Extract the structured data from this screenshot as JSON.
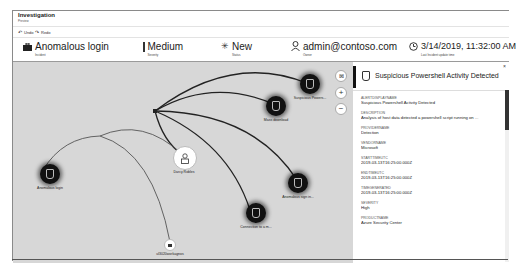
{
  "window": {
    "title": "Investigation",
    "subtitle": "Preview"
  },
  "commands": {
    "undo": "Undo",
    "redo": "Redo"
  },
  "header": {
    "incident": {
      "value": "Anomalous login",
      "label": "Incident",
      "icon": "briefcase-icon"
    },
    "severity": {
      "value": "Medium",
      "label": "Severity",
      "color": "#333333"
    },
    "status": {
      "value": "New",
      "label": "Status",
      "icon": "sparkle-icon"
    },
    "owner": {
      "value": "admin@contoso.com",
      "label": "Owner",
      "icon": "person-icon"
    },
    "updated": {
      "value": "3/14/2019, 11:32:00 AM",
      "label": "Last Incident update time",
      "icon": "clock-icon"
    }
  },
  "graph": {
    "nodes": [
      {
        "id": "suspicious-powershell",
        "label": "Suspicious Powers...",
        "type": "alert"
      },
      {
        "id": "mass-download",
        "label": "Mass download",
        "type": "alert"
      },
      {
        "id": "darcy-robles",
        "label": "Darcy Robles",
        "type": "account"
      },
      {
        "id": "anomalous-login",
        "label": "Anomalous login",
        "type": "alert"
      },
      {
        "id": "anomalous-sign-in",
        "label": "Anomalous sign in...",
        "type": "alert"
      },
      {
        "id": "connection-to",
        "label": "Connection to a m...",
        "type": "alert"
      },
      {
        "id": "host",
        "label": "ul3020workagnos",
        "type": "host"
      }
    ],
    "zoom_controls": {
      "fit": "fit-icon",
      "zoom_in": "+",
      "zoom_out": "−"
    }
  },
  "panel": {
    "title": "Suspicious Powershell Activity Detected",
    "close": "×",
    "fields": [
      {
        "key": "ALERTDISPLAYNAME",
        "value": "Suspicious Powershell Activity Detected"
      },
      {
        "key": "DESCRIPTION",
        "value": "Analysis of host data detected a powershell script running on ..."
      },
      {
        "key": "PROVIDERNAME",
        "value": "Detection"
      },
      {
        "key": "VENDORNAME",
        "value": "Microsoft"
      },
      {
        "key": "STARTTIMEUTC",
        "value": "2019-03-13T16:25:00.000Z"
      },
      {
        "key": "ENDTIMEUTC",
        "value": "2019-03-13T16:25:00.000Z"
      },
      {
        "key": "TIMEGENERATED",
        "value": "2019-03-13T16:25:00.000Z"
      },
      {
        "key": "SEVERITY",
        "value": "High"
      },
      {
        "key": "PRODUCTNAME",
        "value": "Azure Security Center"
      }
    ]
  }
}
